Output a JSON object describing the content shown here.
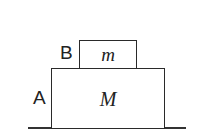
{
  "diagram": {
    "blocks": [
      {
        "id": "A",
        "label": "A",
        "mass_symbol": "M"
      },
      {
        "id": "B",
        "label": "B",
        "mass_symbol": "m"
      }
    ],
    "colors": {
      "stroke": "#2a2a2a",
      "background": "#ffffff"
    }
  }
}
